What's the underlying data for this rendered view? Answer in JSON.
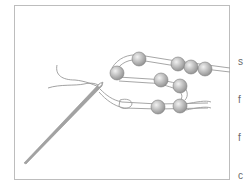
{
  "figure": {
    "frame_border_color": "#bdbdbd",
    "bead_color": "#b8b8b8",
    "needle_color": "#9a9a9a",
    "beads": [
      {
        "cx": 139,
        "cy": 59,
        "r": 7
      },
      {
        "cx": 178,
        "cy": 64,
        "r": 7
      },
      {
        "cx": 191,
        "cy": 67,
        "r": 7
      },
      {
        "cx": 205,
        "cy": 69,
        "r": 7
      },
      {
        "cx": 117,
        "cy": 73,
        "r": 7
      },
      {
        "cx": 161,
        "cy": 80,
        "r": 7
      },
      {
        "cx": 180,
        "cy": 86,
        "r": 7
      },
      {
        "cx": 158,
        "cy": 107,
        "r": 7
      },
      {
        "cx": 180,
        "cy": 106,
        "r": 7
      }
    ]
  },
  "side_text": {
    "lines": [
      "",
      "s",
      "f",
      "f",
      "c",
      "s",
      "f",
      "r",
      "c",
      "l",
      "c",
      "i",
      "t"
    ]
  }
}
